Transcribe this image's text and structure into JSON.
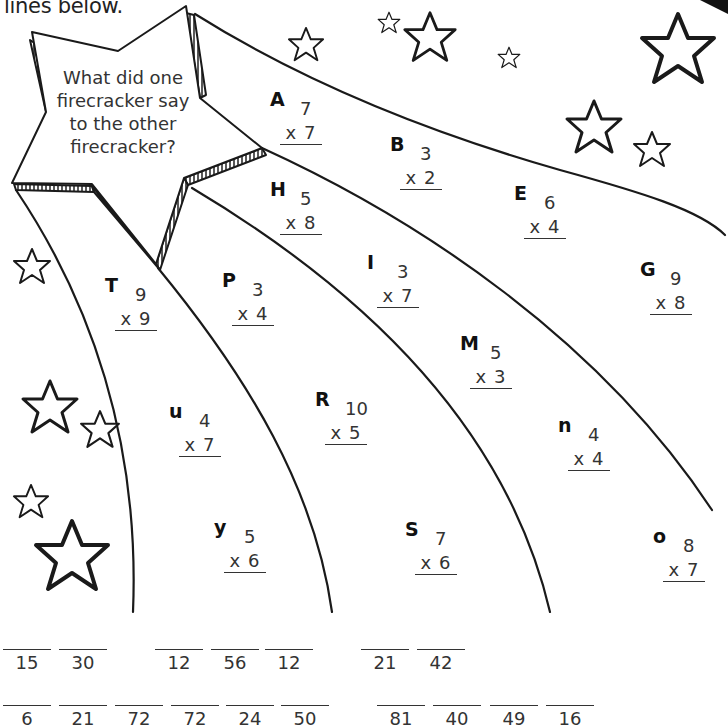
{
  "instruction_fragment": "lines below.",
  "riddle": {
    "question": "What did one firecracker say to the other firecracker?"
  },
  "problems": [
    {
      "letter": "A",
      "top": "7",
      "bottom": "x 7",
      "x": 270,
      "y": 88
    },
    {
      "letter": "B",
      "top": "3",
      "bottom": "x 2",
      "x": 390,
      "y": 133
    },
    {
      "letter": "H",
      "top": "5",
      "bottom": "x 8",
      "x": 270,
      "y": 178
    },
    {
      "letter": "E",
      "top": "6",
      "bottom": "x 4",
      "x": 514,
      "y": 182
    },
    {
      "letter": "I",
      "top": "3",
      "bottom": "x 7",
      "x": 367,
      "y": 251
    },
    {
      "letter": "G",
      "top": "9",
      "bottom": "x 8",
      "x": 640,
      "y": 258
    },
    {
      "letter": "T",
      "top": "9",
      "bottom": "x 9",
      "x": 105,
      "y": 274
    },
    {
      "letter": "P",
      "top": "3",
      "bottom": "x 4",
      "x": 222,
      "y": 269
    },
    {
      "letter": "M",
      "top": "5",
      "bottom": "x 3",
      "x": 460,
      "y": 332
    },
    {
      "letter": "R",
      "top": "10",
      "bottom": "x 5",
      "x": 315,
      "y": 388
    },
    {
      "letter": "u",
      "top": "4",
      "bottom": "x 7",
      "x": 169,
      "y": 400
    },
    {
      "letter": "n",
      "top": "4",
      "bottom": "x 4",
      "x": 558,
      "y": 414
    },
    {
      "letter": "y",
      "top": "5",
      "bottom": "x 6",
      "x": 214,
      "y": 516
    },
    {
      "letter": "S",
      "top": "7",
      "bottom": "x 6",
      "x": 405,
      "y": 518
    },
    {
      "letter": "o",
      "top": "8",
      "bottom": "x 7",
      "x": 653,
      "y": 525
    }
  ],
  "answer_rows": [
    {
      "y": 649,
      "blanks": [
        {
          "value": "15",
          "x": 3
        },
        {
          "value": "30",
          "x": 59
        },
        {
          "value": "12",
          "x": 155
        },
        {
          "value": "56",
          "x": 211
        },
        {
          "value": "12",
          "x": 265
        },
        {
          "value": "21",
          "x": 361
        },
        {
          "value": "42",
          "x": 417
        }
      ]
    },
    {
      "y": 705,
      "blanks": [
        {
          "value": "6",
          "x": 3
        },
        {
          "value": "21",
          "x": 59
        },
        {
          "value": "72",
          "x": 115
        },
        {
          "value": "72",
          "x": 171
        },
        {
          "value": "24",
          "x": 226
        },
        {
          "value": "50",
          "x": 281
        },
        {
          "value": "81",
          "x": 377
        },
        {
          "value": "40",
          "x": 433
        },
        {
          "value": "49",
          "x": 490
        },
        {
          "value": "16",
          "x": 546
        }
      ]
    }
  ]
}
